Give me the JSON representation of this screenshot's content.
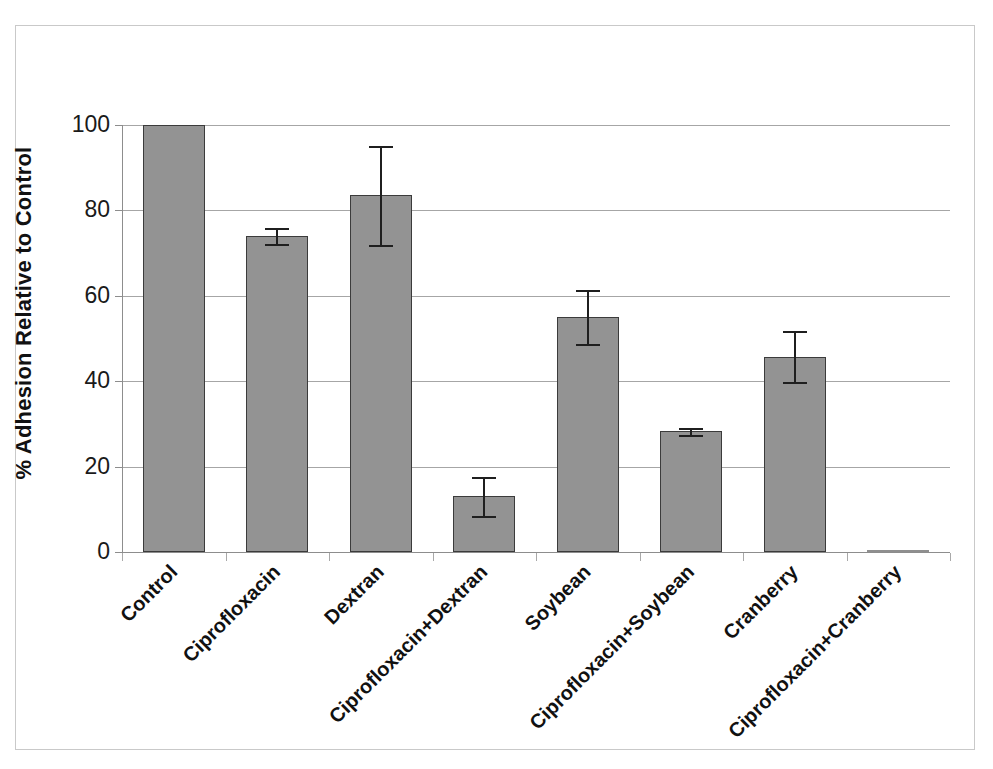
{
  "chart_data": {
    "type": "bar",
    "title": "",
    "xlabel": "",
    "ylabel": "% Adhesion Relative to Control",
    "ylim": [
      0,
      100
    ],
    "yticks": [
      0,
      20,
      40,
      60,
      80,
      100
    ],
    "ytick_labels": [
      "0",
      "20",
      "40",
      "60",
      "80",
      "100"
    ],
    "grid": true,
    "legend": "none",
    "bar_color": "#939393",
    "bar_edge_color": "#3b3b3b",
    "error_bar_color": "#1f1f1f",
    "gridline_color": "#a6a6a6",
    "axis_color": "#8d8d8d",
    "categories": [
      "Control",
      "Ciprofloxacin",
      "Dextran",
      "Ciprofloxacin+Dextran",
      "Soybean",
      "Ciprofloxacin+Soybean",
      "Cranberry",
      "Ciprofloxacin+Cranberry"
    ],
    "values": [
      100,
      74,
      83.5,
      13,
      55,
      28.3,
      45.7,
      0
    ],
    "errors": [
      0,
      1.8,
      11.5,
      4.5,
      6.3,
      0.8,
      6,
      0
    ],
    "series": [
      {
        "name": "% Adhesion Relative to Control",
        "values": [
          100,
          74,
          83.5,
          13,
          55,
          28.3,
          45.7,
          0
        ],
        "errors": [
          0,
          1.8,
          11.5,
          4.5,
          6.3,
          0.8,
          6,
          0
        ]
      }
    ],
    "points": [
      {
        "category": "Control",
        "value": 100,
        "error": 0
      },
      {
        "category": "Ciprofloxacin",
        "value": 74,
        "error": 1.8
      },
      {
        "category": "Dextran",
        "value": 83.5,
        "error": 11.5
      },
      {
        "category": "Ciprofloxacin+Dextran",
        "value": 13,
        "error": 4.5
      },
      {
        "category": "Soybean",
        "value": 55,
        "error": 6.3
      },
      {
        "category": "Ciprofloxacin+Soybean",
        "value": 28.3,
        "error": 0.8
      },
      {
        "category": "Cranberry",
        "value": 45.7,
        "error": 6
      },
      {
        "category": "Ciprofloxacin+Cranberry",
        "value": 0,
        "error": 0
      }
    ]
  }
}
